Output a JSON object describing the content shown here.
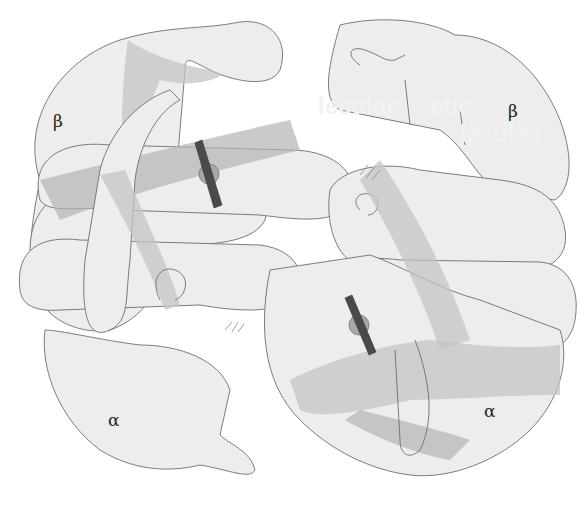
{
  "figure": {
    "subunits": [
      {
        "id": "beta-top-left",
        "label": "β"
      },
      {
        "id": "beta-top-right",
        "label": "β"
      },
      {
        "id": "alpha-bottom-left",
        "label": "α"
      },
      {
        "id": "alpha-bottom-right",
        "label": "α"
      }
    ],
    "heme_groups": 2,
    "show_through_text": [
      "lecular",
      "etic",
      "of Hu",
      "Diseas",
      "lecules:",
      "lobi",
      "ins"
    ],
    "colors": {
      "chain_fill": "#ededed",
      "chain_stroke": "#6e6e6e",
      "helix_band": "#c4c4c4",
      "heme_plate": "#4a4a4a",
      "iron_sphere": "#a8a8a8"
    }
  }
}
